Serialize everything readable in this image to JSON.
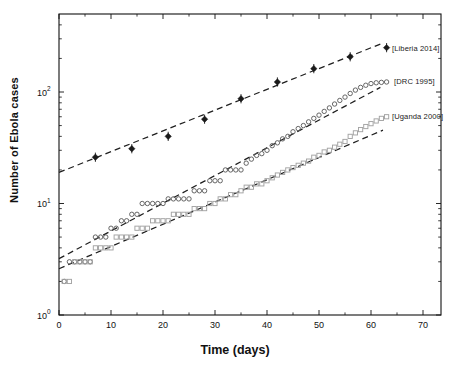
{
  "chart_data": {
    "type": "scatter",
    "title": "",
    "xlabel": "Time (days)",
    "ylabel": "Number of Ebola cases",
    "y_scale": "log",
    "xlim": [
      0,
      73.5
    ],
    "ylim": [
      1,
      500
    ],
    "x_ticks": [
      0,
      10,
      20,
      30,
      40,
      50,
      60,
      70
    ],
    "x_minor_step": 5,
    "y_tick_exponents": [
      0,
      1,
      2
    ],
    "grid": false,
    "legend_position": "inline-right",
    "axis_color": "#111111",
    "fit_line_color": "#1f1f1f",
    "series": [
      {
        "name": "Liberia 2014",
        "legend": "[Liberia 2014]",
        "marker": "diamond",
        "color": "#1a1a1a",
        "error_frac": 0.1,
        "x": [
          7,
          14,
          21,
          28,
          35,
          42,
          49,
          56,
          63
        ],
        "y": [
          26,
          31,
          40,
          57,
          87,
          123,
          162,
          207,
          250
        ],
        "fit": {
          "x": [
            0,
            62.3
          ],
          "y": [
            19,
            275
          ]
        }
      },
      {
        "name": "DRC 1995",
        "legend": "[DRC 1995]",
        "marker": "circle",
        "color": "#5e5e5e",
        "x": [
          1,
          2,
          3,
          4,
          5,
          6,
          7,
          8,
          9,
          10,
          11,
          12,
          13,
          14,
          15,
          16,
          17,
          18,
          19,
          20,
          21,
          22,
          23,
          24,
          25,
          26,
          27,
          28,
          29,
          30,
          31,
          32,
          33,
          34,
          35,
          36,
          37,
          38,
          39,
          40,
          41,
          42,
          43,
          44,
          45,
          46,
          47,
          48,
          49,
          50,
          51,
          52,
          53,
          54,
          55,
          56,
          57,
          58,
          59,
          60,
          61,
          62,
          63
        ],
        "y": [
          2,
          3,
          3,
          3,
          3,
          3,
          5,
          5,
          5,
          6,
          6,
          7,
          7,
          8,
          8,
          10,
          10,
          10,
          10,
          10,
          11,
          11,
          11,
          11,
          11,
          13,
          13,
          13,
          16,
          16,
          16,
          20,
          20,
          20,
          20,
          23,
          25,
          27,
          28,
          30,
          33,
          35,
          38,
          40,
          44,
          47,
          50,
          54,
          58,
          62,
          67,
          72,
          78,
          84,
          90,
          97,
          104,
          110,
          115,
          119,
          121,
          122,
          123
        ],
        "fit": {
          "x": [
            0,
            61.8
          ],
          "y": [
            3.2,
            110
          ]
        }
      },
      {
        "name": "Uganda 2000",
        "legend": "[Uganda 2000]",
        "marker": "square",
        "color": "#a3a3a3",
        "x": [
          1,
          2,
          3,
          4,
          5,
          6,
          7,
          8,
          9,
          10,
          11,
          12,
          13,
          14,
          15,
          16,
          17,
          18,
          19,
          20,
          21,
          22,
          23,
          24,
          25,
          26,
          27,
          28,
          29,
          30,
          31,
          32,
          33,
          34,
          35,
          36,
          37,
          38,
          39,
          40,
          41,
          42,
          43,
          44,
          45,
          46,
          47,
          48,
          49,
          50,
          51,
          52,
          53,
          54,
          55,
          56,
          57,
          58,
          59,
          60,
          61,
          62,
          63
        ],
        "y": [
          2,
          2,
          3,
          3,
          3,
          3,
          4,
          4,
          4,
          4,
          5,
          5,
          5,
          5,
          6,
          6,
          6,
          7,
          7,
          7,
          7,
          8,
          8,
          8,
          8,
          9,
          9,
          9,
          10,
          10,
          11,
          11,
          12,
          12,
          13,
          14,
          14,
          15,
          15,
          16,
          17,
          18,
          19,
          20,
          21,
          22,
          23,
          24,
          26,
          27,
          29,
          30,
          32,
          34,
          36,
          40,
          43,
          46,
          49,
          52,
          55,
          58,
          60
        ],
        "fit": {
          "x": [
            0,
            62.3
          ],
          "y": [
            2.6,
            45.5
          ]
        }
      }
    ]
  }
}
